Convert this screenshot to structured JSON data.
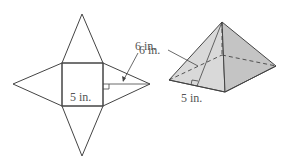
{
  "figure": {
    "net": {
      "base_label": "5 in.",
      "slant_label": "6 in."
    },
    "pyramid": {
      "base_label": "5 in.",
      "slant_label": "6 in."
    },
    "colors": {
      "line": "#444444",
      "face_left": "#d9d9d9",
      "face_right": "#c9c9c9",
      "label": "#555555"
    }
  }
}
